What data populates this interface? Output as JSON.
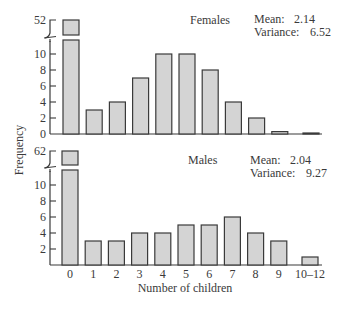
{
  "chart_data": [
    {
      "type": "bar",
      "title": "Females",
      "stats": {
        "mean_label": "Mean:",
        "mean": "2.14",
        "variance_label": "Variance:",
        "variance": "6.52"
      },
      "categories": [
        "0",
        "1",
        "2",
        "3",
        "4",
        "5",
        "6",
        "7",
        "8",
        "9",
        "10–12"
      ],
      "values": [
        52,
        3,
        4,
        7,
        10,
        10,
        8,
        4,
        2,
        0.3,
        0.1
      ],
      "broken_axis": {
        "break_label": "52",
        "top_value": 52
      },
      "ytick_labels": [
        "0",
        "2",
        "4",
        "6",
        "8",
        "10",
        "52"
      ],
      "ylim": [
        0,
        11
      ],
      "xlabel": "Number of children",
      "ylabel": "Frequency",
      "grid": false
    },
    {
      "type": "bar",
      "title": "Males",
      "stats": {
        "mean_label": "Mean:",
        "mean": "2.04",
        "variance_label": "Variance:",
        "variance": "9.27"
      },
      "categories": [
        "0",
        "1",
        "2",
        "3",
        "4",
        "5",
        "6",
        "7",
        "8",
        "9",
        "10–12"
      ],
      "values": [
        62,
        3,
        3,
        4,
        4,
        5,
        5,
        6,
        4,
        3,
        1
      ],
      "broken_axis": {
        "break_label": "62",
        "top_value": 62
      },
      "ytick_labels": [
        "2",
        "4",
        "6",
        "8",
        "10",
        "62"
      ],
      "ylim": [
        0,
        11
      ],
      "xlabel": "Number of children",
      "ylabel": "Frequency",
      "grid": false
    }
  ],
  "labels": {
    "ylabel": "Frequency",
    "xlabel": "Number of children",
    "xticks": [
      "0",
      "1",
      "2",
      "3",
      "4",
      "5",
      "6",
      "7",
      "8",
      "9",
      "10–12"
    ]
  },
  "colors": {
    "bar_fill": "#d4d4d4",
    "bar_stroke": "#3a3a3a",
    "axis": "#3a3a3a",
    "text": "#3a3a3a"
  }
}
